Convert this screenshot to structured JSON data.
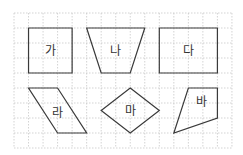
{
  "diagram": {
    "grid": {
      "cols": 15,
      "rows": 9,
      "origin_x": 14,
      "origin_y": 13,
      "cell_w": 14.53,
      "cell_h": 15,
      "line_color": "#c8c8c8"
    },
    "stroke_color": "#3a3a3a",
    "label_color": "#333333",
    "shapes": [
      {
        "label": "가",
        "kind": "square",
        "points": [
          [
            1,
            1
          ],
          [
            4,
            1
          ],
          [
            4,
            4
          ],
          [
            1,
            4
          ]
        ],
        "label_pos": [
          2.5,
          2.5
        ]
      },
      {
        "label": "나",
        "kind": "trapezoid",
        "points": [
          [
            5,
            1
          ],
          [
            9,
            1
          ],
          [
            8,
            4
          ],
          [
            6,
            4
          ]
        ],
        "label_pos": [
          7,
          2.5
        ]
      },
      {
        "label": "다",
        "kind": "rectangle",
        "points": [
          [
            10,
            1
          ],
          [
            14,
            1
          ],
          [
            14,
            4
          ],
          [
            10,
            4
          ]
        ],
        "label_pos": [
          12,
          2.5
        ]
      },
      {
        "label": "라",
        "kind": "parallelogram",
        "points": [
          [
            1,
            5
          ],
          [
            3,
            5
          ],
          [
            5,
            8
          ],
          [
            3,
            8
          ]
        ],
        "label_pos": [
          3,
          6.6
        ]
      },
      {
        "label": "마",
        "kind": "rhombus",
        "points": [
          [
            8,
            5
          ],
          [
            10,
            6.5
          ],
          [
            8,
            8
          ],
          [
            6,
            6.5
          ]
        ],
        "label_pos": [
          8,
          6.5
        ]
      },
      {
        "label": "바",
        "kind": "quadrilateral",
        "points": [
          [
            12,
            5
          ],
          [
            14,
            5
          ],
          [
            14,
            7
          ],
          [
            11,
            8
          ]
        ],
        "label_pos": [
          12.9,
          5.9
        ]
      }
    ]
  }
}
